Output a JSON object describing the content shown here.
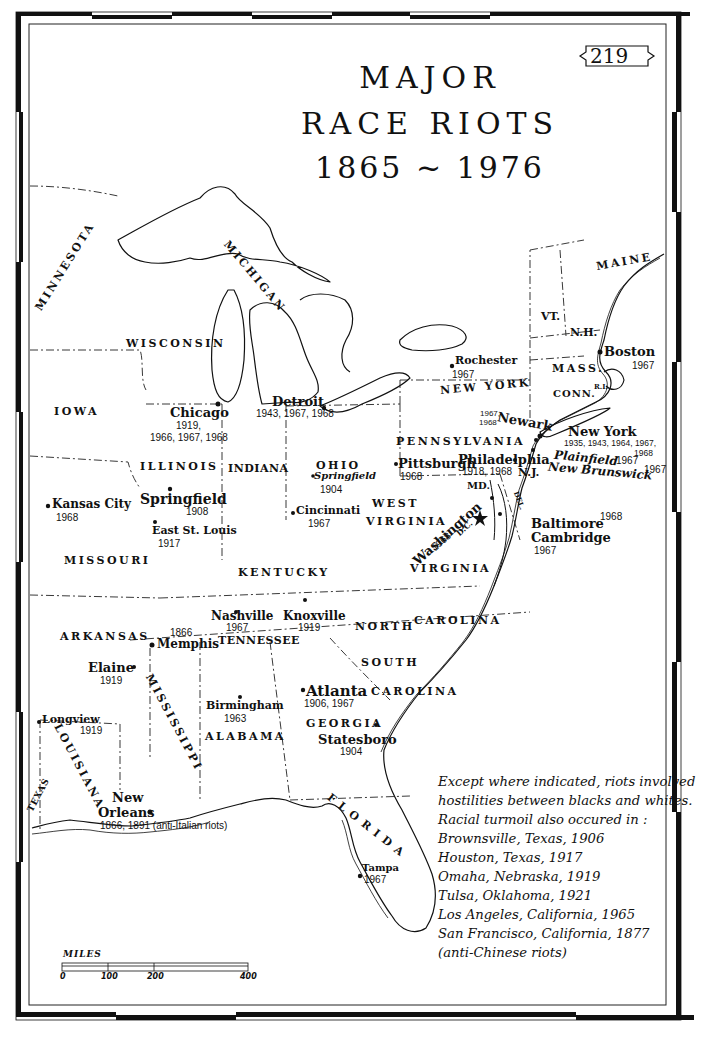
{
  "map": {
    "page_number": "219",
    "title_line1": "MAJOR",
    "title_line2": "RACE RIOTS",
    "title_line3": "1865 ~ 1976",
    "states": {
      "minnesota": "MINNESOTA",
      "wisconsin": "WISCONSIN",
      "michigan": "MICHIGAN",
      "iowa": "IOWA",
      "illinois": "ILLINOIS",
      "indiana": "INDIANA",
      "ohio": "OHIO",
      "missouri": "MISSOURI",
      "kentucky": "KENTUCKY",
      "west": "WEST",
      "virginia_w": "VIRGINIA",
      "virginia": "VIRGINIA",
      "pennsylvania": "PENNSYLVANIA",
      "new_york": "NEW YORK",
      "maine": "MAINE",
      "vt": "VT.",
      "nh": "N.H.",
      "mass": "MASS.",
      "conn": "CONN.",
      "ri": "R.I.",
      "nj": "N.J.",
      "md": "MD.",
      "del": "DEL.",
      "dc": "D.C.",
      "arkansas": "ARKANSAS",
      "tennessee": "TENNESSEE",
      "north": "NORTH",
      "carolina_n": "CAROLINA",
      "south": "SOUTH",
      "carolina_s": "CAROLINA",
      "mississippi": "MISSISSIPPI",
      "alabama": "ALABAMA",
      "georgia": "GEORGIA",
      "louisiana": "LOUISIANA",
      "texas": "TEXAS",
      "florida": "FLORIDA"
    },
    "cities": [
      {
        "name": "Rochester",
        "years": "1967"
      },
      {
        "name": "Boston",
        "years": "1967"
      },
      {
        "name": "Detroit",
        "years": "1943, 1967, 1968"
      },
      {
        "name": "Chicago",
        "years": "1919,",
        "years2": "1966, 1967, 1968"
      },
      {
        "name": "Newark",
        "years": "1967,",
        "years2": "1968"
      },
      {
        "name": "New York",
        "years": "1935, 1943, 1964, 1967,",
        "years2": "1968"
      },
      {
        "name": "Pittsburgh",
        "years": "1968"
      },
      {
        "name": "Philadelphia",
        "years": "1918, 1968"
      },
      {
        "name": "Plainfield",
        "years": "1967"
      },
      {
        "name": "New Brunswick",
        "years": "1967"
      },
      {
        "name": "Springfield",
        "years": "1904",
        "state": "Ohio"
      },
      {
        "name": "Springfield",
        "years": "1908",
        "state": "Illinois"
      },
      {
        "name": "Kansas City",
        "years": "1968"
      },
      {
        "name": "East St. Louis",
        "years": "1917"
      },
      {
        "name": "Cincinnati",
        "years": "1967"
      },
      {
        "name": "Washington",
        "years": "1968"
      },
      {
        "name": "Baltimore",
        "years": "1968"
      },
      {
        "name": "Cambridge",
        "years": "1967"
      },
      {
        "name": "Nashville",
        "years": "1967"
      },
      {
        "name": "Knoxville",
        "years": "1919"
      },
      {
        "name": "Memphis",
        "years": "1866"
      },
      {
        "name": "Elaine",
        "years": "1919"
      },
      {
        "name": "Atlanta",
        "years": "1906, 1967"
      },
      {
        "name": "Birmingham",
        "years": "1963"
      },
      {
        "name": "Statesboro",
        "years": "1904"
      },
      {
        "name": "Longview",
        "years": "1919"
      },
      {
        "name": "New",
        "name2": "Orleans",
        "years": "1866, 1891 (anti-Italian riots)"
      },
      {
        "name": "Tampa",
        "years": "1967"
      }
    ],
    "legend": [
      "Except where indicated, riots involved",
      "hostilities between blacks and whites.",
      "Racial turmoil also occured in :",
      "Brownsville, Texas, 1906",
      "Houston, Texas, 1917",
      "Omaha, Nebraska, 1919",
      "Tulsa, Oklahoma, 1921",
      "Los Angeles, California, 1965",
      "San Francisco, California, 1877",
      "(anti-Chinese riots)"
    ],
    "scale": {
      "title": "MILES",
      "ticks": [
        "0",
        "100",
        "200",
        "400"
      ]
    },
    "colors": {
      "ink": "#111111",
      "paper": "#ffffff"
    }
  }
}
